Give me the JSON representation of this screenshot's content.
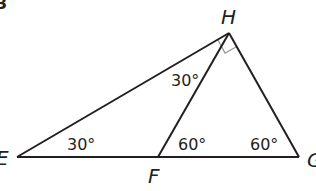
{
  "figure": {
    "stroke_color": "#231f20",
    "right_angle_color": "#9a9a9a",
    "points": {
      "H": {
        "label": "H",
        "x": 229,
        "y": 33
      },
      "E": {
        "label": "E",
        "x": 17,
        "y": 157
      },
      "F": {
        "label": "F",
        "x": 158,
        "y": 157
      },
      "G": {
        "label": "G",
        "x": 299,
        "y": 157
      }
    },
    "angles": {
      "E": "30°",
      "HFG": "60°",
      "G": "60°",
      "EHF": "30°"
    },
    "right_angle_at": "H",
    "corner_mark": "3"
  }
}
